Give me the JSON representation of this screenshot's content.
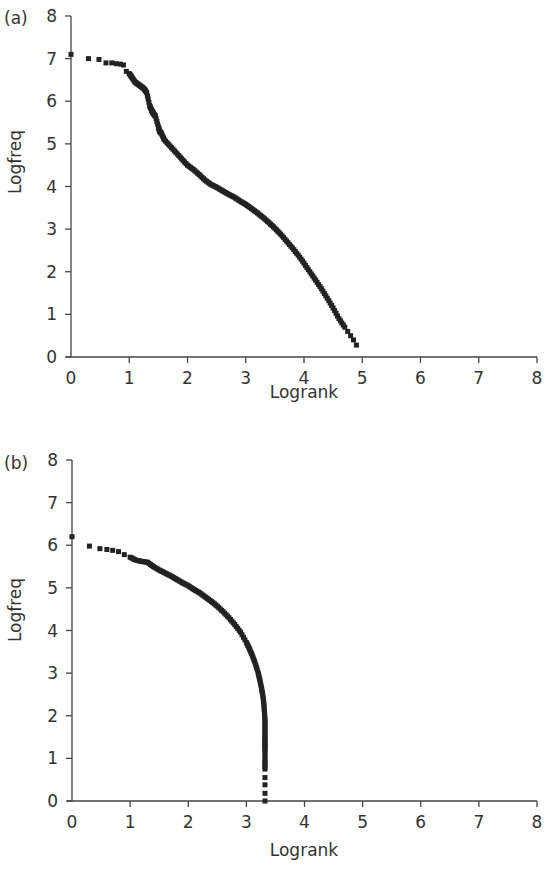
{
  "chart_data": [
    {
      "panel": "(a)",
      "type": "scatter",
      "title": "",
      "xlabel": "Logrank",
      "ylabel": "Logfreq",
      "xlim": [
        0,
        8
      ],
      "ylim": [
        0,
        8
      ],
      "xticks": [
        0,
        1,
        2,
        3,
        4,
        5,
        6,
        7,
        8
      ],
      "yticks": [
        0,
        1,
        2,
        3,
        4,
        5,
        6,
        7,
        8
      ],
      "grid": false,
      "legend": null,
      "x": [
        0,
        0.3,
        0.48,
        0.6,
        0.7,
        0.78,
        0.85,
        0.9,
        0.95,
        1.0,
        1.05,
        1.1,
        1.15,
        1.2,
        1.25,
        1.3,
        1.35,
        1.38,
        1.4,
        1.42,
        1.45,
        1.5,
        1.52,
        1.55,
        1.6,
        1.7,
        1.8,
        1.9,
        2.0,
        2.1,
        2.2,
        2.3,
        2.4,
        2.5,
        2.6,
        2.7,
        2.8,
        2.9,
        3.0,
        3.1,
        3.2,
        3.3,
        3.4,
        3.5,
        3.6,
        3.7,
        3.8,
        3.9,
        4.0,
        4.1,
        4.2,
        4.3,
        4.4,
        4.5,
        4.6,
        4.7,
        4.75,
        4.8,
        4.85,
        4.9
      ],
      "y": [
        7.1,
        7.0,
        6.98,
        6.9,
        6.9,
        6.88,
        6.87,
        6.85,
        6.7,
        6.65,
        6.55,
        6.45,
        6.4,
        6.35,
        6.3,
        6.2,
        5.9,
        5.8,
        5.75,
        5.7,
        5.65,
        5.4,
        5.3,
        5.25,
        5.1,
        4.95,
        4.8,
        4.65,
        4.5,
        4.4,
        4.28,
        4.15,
        4.05,
        3.98,
        3.9,
        3.82,
        3.75,
        3.66,
        3.58,
        3.48,
        3.38,
        3.27,
        3.15,
        3.02,
        2.88,
        2.72,
        2.56,
        2.39,
        2.2,
        2.0,
        1.8,
        1.6,
        1.38,
        1.15,
        0.9,
        0.7,
        0.6,
        0.5,
        0.4,
        0.28
      ]
    },
    {
      "panel": "(b)",
      "type": "scatter",
      "title": "",
      "xlabel": "Logrank",
      "ylabel": "Logfreq",
      "xlim": [
        0,
        8
      ],
      "ylim": [
        0,
        8
      ],
      "xticks": [
        0,
        1,
        2,
        3,
        4,
        5,
        6,
        7,
        8
      ],
      "yticks": [
        0,
        1,
        2,
        3,
        4,
        5,
        6,
        7,
        8
      ],
      "grid": false,
      "legend": null,
      "x": [
        0,
        0.3,
        0.48,
        0.6,
        0.7,
        0.8,
        0.9,
        1.0,
        1.1,
        1.2,
        1.3,
        1.4,
        1.5,
        1.6,
        1.7,
        1.8,
        1.9,
        2.0,
        2.1,
        2.2,
        2.3,
        2.4,
        2.5,
        2.6,
        2.7,
        2.8,
        2.9,
        3.0,
        3.05,
        3.1,
        3.15,
        3.2,
        3.23,
        3.26,
        3.28,
        3.3,
        3.31,
        3.32,
        3.32,
        3.32,
        3.32,
        3.32,
        3.32,
        3.32,
        3.32,
        3.32,
        3.32,
        3.32
      ],
      "y": [
        6.2,
        5.98,
        5.92,
        5.9,
        5.88,
        5.85,
        5.78,
        5.72,
        5.65,
        5.62,
        5.6,
        5.5,
        5.42,
        5.35,
        5.28,
        5.2,
        5.12,
        5.05,
        4.96,
        4.88,
        4.78,
        4.68,
        4.57,
        4.44,
        4.3,
        4.14,
        3.96,
        3.72,
        3.58,
        3.42,
        3.24,
        3.02,
        2.85,
        2.65,
        2.5,
        2.3,
        2.1,
        1.9,
        1.7,
        1.5,
        1.35,
        1.2,
        0.95,
        0.75,
        0.55,
        0.38,
        0.18,
        0.0
      ]
    }
  ],
  "panels": [
    {
      "label": "(a)",
      "xlabel": "Logrank",
      "ylabel": "Logfreq"
    },
    {
      "label": "(b)",
      "xlabel": "Logrank",
      "ylabel": "Logfreq"
    }
  ]
}
